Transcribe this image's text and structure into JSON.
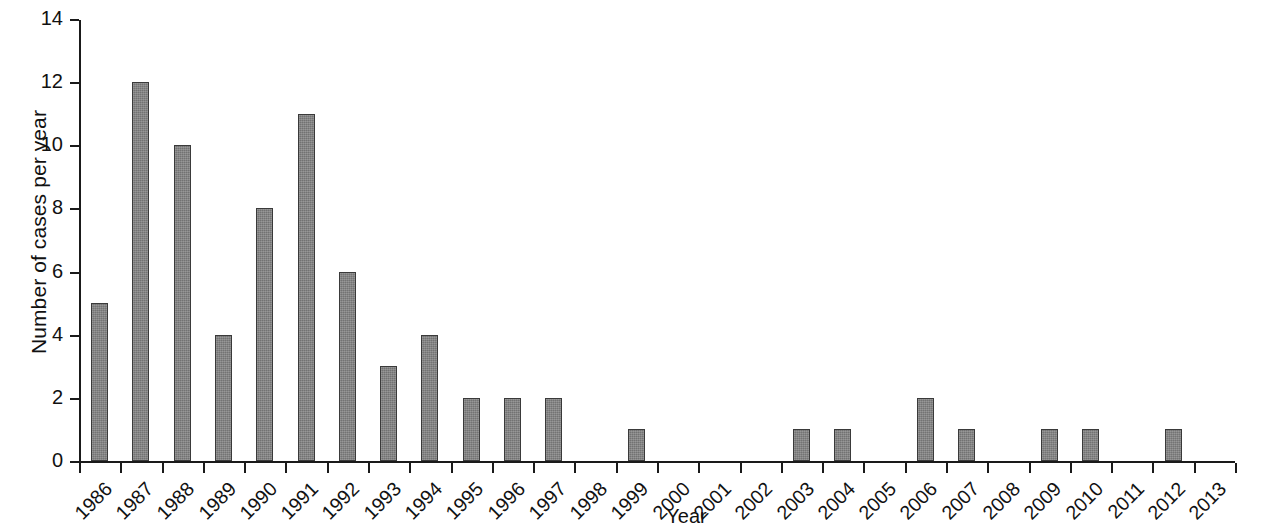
{
  "chart_data": {
    "type": "bar",
    "title": "",
    "subtitle": "",
    "xlabel": "Year",
    "ylabel": "Number of cases per year",
    "categories": [
      "1986",
      "1987",
      "1988",
      "1989",
      "1990",
      "1991",
      "1992",
      "1993",
      "1994",
      "1995",
      "1996",
      "1997",
      "1998",
      "1999",
      "2000",
      "2001",
      "2002",
      "2003",
      "2004",
      "2005",
      "2006",
      "2007",
      "2008",
      "2009",
      "2010",
      "2011",
      "2012",
      "2013"
    ],
    "values": [
      5,
      12,
      10,
      4,
      8,
      11,
      6,
      3,
      4,
      2,
      2,
      2,
      0,
      1,
      0,
      0,
      0,
      1,
      1,
      0,
      2,
      1,
      0,
      1,
      1,
      0,
      1,
      0
    ],
    "series": [
      {
        "name": "Number of cases per year",
        "values": [
          5,
          12,
          10,
          4,
          8,
          11,
          6,
          3,
          4,
          2,
          2,
          2,
          0,
          1,
          0,
          0,
          0,
          1,
          1,
          0,
          2,
          1,
          0,
          1,
          1,
          0,
          1,
          0
        ]
      }
    ],
    "ylim": [
      0,
      14
    ],
    "yticks": [
      0,
      2,
      4,
      6,
      8,
      10,
      12,
      14
    ],
    "ytick_labels": [
      "0",
      "2",
      "4",
      "6",
      "8",
      "10",
      "12",
      "14"
    ],
    "grid": false,
    "legend": false,
    "legend_position": "none",
    "bar_color": "#808080",
    "bar_edge_color": "#3a3a3a",
    "axis_color": "#1a1a1a",
    "background_color": "#ffffff",
    "xtick_label_rotation": -45
  }
}
